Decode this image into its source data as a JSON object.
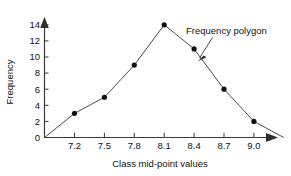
{
  "chart_data": {
    "type": "line",
    "title": "",
    "xlabel": "Class mid-point values",
    "ylabel": "Frequency",
    "x": [
      7.2,
      7.5,
      7.8,
      8.1,
      8.4,
      8.7,
      9.0
    ],
    "values": [
      3,
      5,
      9,
      14,
      11,
      6,
      2
    ],
    "xtick_labels": [
      "7.2",
      "7.5",
      "7.8",
      "8.1",
      "8.4",
      "8.7",
      "9.0"
    ],
    "ytick_labels": [
      "0",
      "2",
      "4",
      "6",
      "8",
      "10",
      "12",
      "14"
    ],
    "ytick_values": [
      0,
      2,
      4,
      6,
      8,
      10,
      12,
      14
    ],
    "ylim": [
      0,
      15
    ],
    "xlim": [
      6.9,
      9.3
    ],
    "grid": false,
    "legend": "none",
    "markers": "filled-circle",
    "baseline_anchors": [
      {
        "x": 6.9,
        "y": 0
      },
      {
        "x": 9.3,
        "y": 0
      }
    ],
    "annotations": [
      {
        "text": "Frequency polygon",
        "points_to_x": 8.5,
        "points_to_y": 9.4
      }
    ],
    "series_color": "#4a4a4a",
    "marker_color": "#111111",
    "axis_color": "#3a3a3a"
  },
  "axes": {
    "y_label": "Frequency",
    "x_label": "Class mid-point values"
  },
  "annotation": {
    "label": "Frequency polygon"
  },
  "xticks": [
    {
      "label": "7.2"
    },
    {
      "label": "7.5"
    },
    {
      "label": "7.8"
    },
    {
      "label": "8.1"
    },
    {
      "label": "8.4"
    },
    {
      "label": "8.7"
    },
    {
      "label": "9.0"
    }
  ],
  "yticks": [
    {
      "label": "0"
    },
    {
      "label": "2"
    },
    {
      "label": "4"
    },
    {
      "label": "6"
    },
    {
      "label": "8"
    },
    {
      "label": "10"
    },
    {
      "label": "12"
    },
    {
      "label": "14"
    }
  ]
}
